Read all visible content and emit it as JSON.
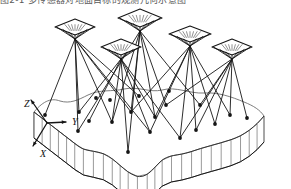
{
  "figure": {
    "caption_partial": "图2-1  多传感器对地面目标的观测几何示意图",
    "background_color": "#ffffff",
    "ink_color": "#151515",
    "terrain_line_color": "#6e6e6e"
  },
  "axes": {
    "origin": {
      "x": 47,
      "y": 123
    },
    "labels": [
      {
        "name": "z-axis-label",
        "text": "Z",
        "x": 24,
        "y": 107
      },
      {
        "name": "y-axis-label",
        "text": "Y",
        "x": 72,
        "y": 125
      },
      {
        "name": "x-axis-label",
        "text": "X",
        "x": 40,
        "y": 157
      }
    ],
    "z_tip": {
      "x": 31,
      "y": 100
    },
    "y_tip": {
      "x": 66,
      "y": 122
    },
    "x_tip": {
      "x": 33,
      "y": 146
    }
  },
  "sensors": [
    {
      "id": "sensor-1",
      "cx": 75,
      "cy": 27,
      "rx": 20,
      "ry": 8,
      "apex_x": 75,
      "apex_y": 39,
      "rays": 7
    },
    {
      "id": "sensor-2",
      "cx": 121,
      "cy": 47,
      "rx": 20,
      "ry": 8,
      "apex_x": 121,
      "apex_y": 59,
      "rays": 7
    },
    {
      "id": "sensor-3",
      "cx": 140,
      "cy": 18,
      "rx": 22,
      "ry": 9,
      "apex_x": 140,
      "apex_y": 31,
      "rays": 7
    },
    {
      "id": "sensor-4",
      "cx": 190,
      "cy": 34,
      "rx": 21,
      "ry": 8,
      "apex_x": 190,
      "apex_y": 46,
      "rays": 7
    },
    {
      "id": "sensor-5",
      "cx": 232,
      "cy": 47,
      "rx": 20,
      "ry": 8,
      "apex_x": 232,
      "apex_y": 59,
      "rays": 7
    }
  ],
  "ground_targets": [
    {
      "id": "t1",
      "x": 45,
      "y": 115
    },
    {
      "id": "t2",
      "x": 78,
      "y": 131
    },
    {
      "id": "t3",
      "x": 79,
      "y": 112
    },
    {
      "id": "t4",
      "x": 89,
      "y": 121
    },
    {
      "id": "t5",
      "x": 112,
      "y": 122
    },
    {
      "id": "t6",
      "x": 110,
      "y": 100
    },
    {
      "id": "t7",
      "x": 128,
      "y": 152
    },
    {
      "id": "t8",
      "x": 131,
      "y": 112
    },
    {
      "id": "t9",
      "x": 150,
      "y": 132
    },
    {
      "id": "t10",
      "x": 155,
      "y": 117
    },
    {
      "id": "t11",
      "x": 166,
      "y": 105
    },
    {
      "id": "t12",
      "x": 139,
      "y": 96
    },
    {
      "id": "t13",
      "x": 180,
      "y": 138
    },
    {
      "id": "t14",
      "x": 196,
      "y": 130
    },
    {
      "id": "t15",
      "x": 200,
      "y": 105
    },
    {
      "id": "t16",
      "x": 215,
      "y": 124
    },
    {
      "id": "t17",
      "x": 230,
      "y": 115
    },
    {
      "id": "t18",
      "x": 247,
      "y": 118
    },
    {
      "id": "t19",
      "x": 169,
      "y": 91
    },
    {
      "id": "t20",
      "x": 96,
      "y": 98
    }
  ],
  "ray_links": [
    [
      0,
      "t1"
    ],
    [
      0,
      "t2"
    ],
    [
      0,
      "t3"
    ],
    [
      0,
      "t5"
    ],
    [
      0,
      "t8"
    ],
    [
      0,
      "t9"
    ],
    [
      0,
      "t12"
    ],
    [
      1,
      "t4"
    ],
    [
      1,
      "t5"
    ],
    [
      1,
      "t7"
    ],
    [
      1,
      "t9"
    ],
    [
      1,
      "t10"
    ],
    [
      1,
      "t13"
    ],
    [
      1,
      "t3"
    ],
    [
      2,
      "t2"
    ],
    [
      2,
      "t5"
    ],
    [
      2,
      "t7"
    ],
    [
      2,
      "t8"
    ],
    [
      2,
      "t10"
    ],
    [
      2,
      "t11"
    ],
    [
      2,
      "t15"
    ],
    [
      3,
      "t9"
    ],
    [
      3,
      "t10"
    ],
    [
      3,
      "t13"
    ],
    [
      3,
      "t14"
    ],
    [
      3,
      "t16"
    ],
    [
      3,
      "t17"
    ],
    [
      3,
      "t8"
    ],
    [
      4,
      "t14"
    ],
    [
      4,
      "t15"
    ],
    [
      4,
      "t16"
    ],
    [
      4,
      "t17"
    ],
    [
      4,
      "t18"
    ],
    [
      4,
      "t11"
    ],
    [
      4,
      "t13"
    ]
  ],
  "terrain_slab": {
    "top_surface_path": "M 34,112 C 44,100 52,98 60,101 C 70,104 78,100 88,95 C 100,89 112,92 124,89 C 138,86 150,93 162,90 C 176,86 190,94 204,93 C 218,92 232,97 244,102 C 254,106 260,110 264,116",
    "wavy_front_path": "M 34,112 L 78,146 C 86,152 94,150 104,154 C 116,159 124,172 136,176 C 146,179 152,170 160,162 C 168,154 178,156 190,152 C 204,147 218,144 230,140 C 244,136 256,126 264,116",
    "side_hatch_count": 26,
    "slab_depth": 26
  },
  "annotations": {
    "diagram_type": "3d-sensor-observation-geometry",
    "sensor_count": 5,
    "target_count": 20
  }
}
